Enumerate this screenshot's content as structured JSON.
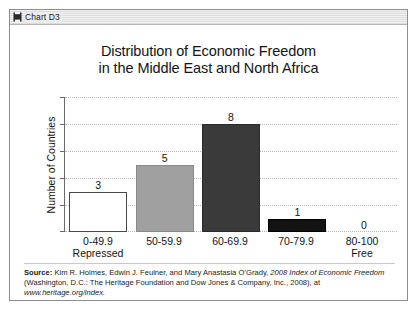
{
  "window": {
    "title": "Chart D3",
    "icon": "document-chart-icon"
  },
  "chart_data": {
    "type": "bar",
    "title_line1": "Distribution of Economic Freedom",
    "title_line2": "in the Middle East and North Africa",
    "xlabel": "",
    "ylabel": "Number of Countries",
    "ylim": [
      0,
      10
    ],
    "yticks": [
      0,
      2,
      4,
      6,
      8,
      10
    ],
    "grid": true,
    "legend": "none",
    "categories": [
      "0-49.9",
      "50-59.9",
      "60-69.9",
      "70-79.9",
      "80-100"
    ],
    "category_sublabels": [
      "Repressed",
      "",
      "",
      "",
      "Free"
    ],
    "values": [
      3,
      5,
      8,
      1,
      0
    ],
    "value_labels": [
      "3",
      "5",
      "8",
      "1",
      "0"
    ],
    "bar_colors": [
      "#ffffff",
      "#a0a0a0",
      "#3a3a3a",
      "#131313",
      "#ffffff"
    ],
    "bar_border_colors": [
      "#4a4a4a",
      "#8a8a8a",
      "#2a2a2a",
      "#000000",
      "#ffffff"
    ]
  },
  "source": {
    "label": "Source:",
    "line1_rest": " Kim R. Holmes, Edwin J. Feulner, and Mary Anastasia O’Grady, ",
    "italic_title": "2008 Index of Economic Freedom",
    "line2_rest": " (Washington, D.C.: The Heritage Foundation and Dow Jones & Company, Inc., 2008), at ",
    "url": "www.heritage.org/index."
  },
  "colors": {
    "text": "#141414",
    "axis": "#6a6a6a",
    "grid": "#b9b9b9",
    "frame": "#8e8e8e"
  }
}
